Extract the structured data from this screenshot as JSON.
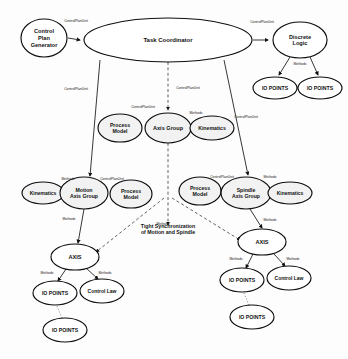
{
  "diagram": {
    "title_text": "",
    "nodes": [
      {
        "id": "control-plan-generator",
        "label_lines": [
          "Control",
          "Plan",
          "Generator"
        ],
        "cx": 44,
        "cy": 38,
        "rx": 23,
        "ry": 19,
        "font": 5.6,
        "style": "plain"
      },
      {
        "id": "task-coordinator",
        "label_lines": [
          "Task Coordinator"
        ],
        "cx": 168,
        "cy": 40,
        "rx": 84,
        "ry": 22,
        "font": 6.0,
        "style": "plain"
      },
      {
        "id": "discrete-logic",
        "label_lines": [
          "Discrete",
          "Logic"
        ],
        "cx": 300,
        "cy": 40,
        "rx": 27,
        "ry": 18,
        "font": 5.6,
        "style": "plain"
      },
      {
        "id": "io-points-dl-left",
        "label_lines": [
          "IO POINTS"
        ],
        "cx": 275,
        "cy": 88,
        "rx": 22,
        "ry": 11,
        "font": 5.2,
        "style": "plain"
      },
      {
        "id": "io-points-dl-right",
        "label_lines": [
          "IO POINTS"
        ],
        "cx": 320,
        "cy": 88,
        "rx": 22,
        "ry": 11,
        "font": 5.2,
        "style": "plain"
      },
      {
        "id": "process-model-center",
        "label_lines": [
          "Process",
          "Model"
        ],
        "cx": 120,
        "cy": 128,
        "rx": 22,
        "ry": 14,
        "font": 5.2,
        "style": "shaded"
      },
      {
        "id": "axis-group",
        "label_lines": [
          "Axis Group"
        ],
        "cx": 168,
        "cy": 128,
        "rx": 23,
        "ry": 15,
        "font": 5.6,
        "style": "shaded"
      },
      {
        "id": "kinematics-center",
        "label_lines": [
          "Kinematics"
        ],
        "cx": 212,
        "cy": 128,
        "rx": 22,
        "ry": 12,
        "font": 5.2,
        "style": "shaded"
      },
      {
        "id": "kinematics-left",
        "label_lines": [
          "Kinematics"
        ],
        "cx": 43,
        "cy": 193,
        "rx": 21,
        "ry": 11,
        "font": 5.0,
        "style": "shaded"
      },
      {
        "id": "motion-axis-group",
        "label_lines": [
          "Motion",
          "Axis Group"
        ],
        "cx": 84,
        "cy": 193,
        "rx": 24,
        "ry": 16,
        "font": 5.2,
        "style": "shaded"
      },
      {
        "id": "process-model-left",
        "label_lines": [
          "Process",
          "Model"
        ],
        "cx": 131,
        "cy": 194,
        "rx": 21,
        "ry": 14,
        "font": 5.2,
        "style": "shaded"
      },
      {
        "id": "process-model-right",
        "label_lines": [
          "Process",
          "Model"
        ],
        "cx": 200,
        "cy": 191,
        "rx": 21,
        "ry": 14,
        "font": 5.2,
        "style": "shaded"
      },
      {
        "id": "spindle-axis-group",
        "label_lines": [
          "Spindle",
          "Axis Group"
        ],
        "cx": 246,
        "cy": 193,
        "rx": 25,
        "ry": 16,
        "font": 5.2,
        "style": "shaded"
      },
      {
        "id": "kinematics-right",
        "label_lines": [
          "Kinematics"
        ],
        "cx": 290,
        "cy": 193,
        "rx": 22,
        "ry": 11,
        "font": 5.0,
        "style": "shaded"
      },
      {
        "id": "axis-left",
        "label_lines": [
          "AXIS"
        ],
        "cx": 75,
        "cy": 257,
        "rx": 24,
        "ry": 13,
        "font": 5.6,
        "style": "plain"
      },
      {
        "id": "axis-right",
        "label_lines": [
          "AXIS"
        ],
        "cx": 262,
        "cy": 242,
        "rx": 24,
        "ry": 13,
        "font": 5.6,
        "style": "plain"
      },
      {
        "id": "io-points-left",
        "label_lines": [
          "IO POINTS"
        ],
        "cx": 55,
        "cy": 293,
        "rx": 22,
        "ry": 12,
        "font": 5.2,
        "style": "plain"
      },
      {
        "id": "control-law-left",
        "label_lines": [
          "Control Law"
        ],
        "cx": 102,
        "cy": 291,
        "rx": 22,
        "ry": 12,
        "font": 5.0,
        "style": "plain"
      },
      {
        "id": "io-points-left-2",
        "label_lines": [
          "IO POINTS"
        ],
        "cx": 65,
        "cy": 330,
        "rx": 22,
        "ry": 12,
        "font": 5.2,
        "style": "plain"
      },
      {
        "id": "io-points-right",
        "label_lines": [
          "IO POINTS"
        ],
        "cx": 242,
        "cy": 280,
        "rx": 22,
        "ry": 12,
        "font": 5.2,
        "style": "plain"
      },
      {
        "id": "control-law-right",
        "label_lines": [
          "Control Law"
        ],
        "cx": 289,
        "cy": 278,
        "rx": 22,
        "ry": 12,
        "font": 5.0,
        "style": "plain"
      },
      {
        "id": "io-points-right-2",
        "label_lines": [
          "IO POINTS"
        ],
        "cx": 252,
        "cy": 317,
        "rx": 22,
        "ry": 12,
        "font": 5.2,
        "style": "plain"
      }
    ],
    "edges": [
      {
        "id": "cpg-to-tc",
        "kind": "solid",
        "path": "M 68 38 L 80 40",
        "label": "ControlPlanUnit",
        "lx": 76,
        "ly": 22
      },
      {
        "id": "tc-to-dl",
        "kind": "solid",
        "path": "M 253 40 L 268 40",
        "label": "ControlPlanUnit",
        "lx": 262,
        "ly": 23
      },
      {
        "id": "dl-to-io-left",
        "kind": "solid",
        "path": "M 290 57 L 279 75",
        "label": "Methods",
        "lx": 300,
        "ly": 65
      },
      {
        "id": "dl-to-io-right",
        "kind": "solid",
        "path": "M 310 57 L 318 75",
        "label": "",
        "lx": 0,
        "ly": 0
      },
      {
        "id": "io-dl-link",
        "kind": "dotted",
        "path": "M 297 88 L 299 88",
        "label": "",
        "lx": 0,
        "ly": 0
      },
      {
        "id": "tc-to-axisgroup",
        "kind": "dashed",
        "path": "M 168 62 L 168 110",
        "label": "ControlPlanUnit",
        "lx": 188,
        "ly": 89
      },
      {
        "id": "axisgroup-cpu-label",
        "kind": "none",
        "path": "",
        "label": "ControlPlanUnit",
        "lx": 143,
        "ly": 108
      },
      {
        "id": "axisgroup-methods-label",
        "kind": "none",
        "path": "",
        "label": "Methods",
        "lx": 196,
        "ly": 114
      },
      {
        "id": "tc-to-motion",
        "kind": "solid",
        "path": "M 100 60 L 90 176",
        "label": "ControlPlanUnit",
        "lx": 76,
        "ly": 90
      },
      {
        "id": "tc-to-spindle",
        "kind": "solid",
        "path": "M 224 60 L 248 175",
        "label": "ControlPlanUnit",
        "lx": 246,
        "ly": 118
      },
      {
        "id": "motion-cpu-label",
        "kind": "none",
        "path": "",
        "label": "ControlPlanUnit",
        "lx": 112,
        "ly": 180
      },
      {
        "id": "motion-methods-label",
        "kind": "none",
        "path": "",
        "label": "Methods",
        "lx": 68,
        "ly": 180
      },
      {
        "id": "spindle-cpu-label",
        "kind": "none",
        "path": "",
        "label": "ControlPlanUnit",
        "lx": 222,
        "ly": 178
      },
      {
        "id": "spindle-methods-label",
        "kind": "none",
        "path": "",
        "label": "Methods",
        "lx": 270,
        "ly": 178
      },
      {
        "id": "axisgroup-down-dashed",
        "kind": "dashed",
        "path": "M 168 143 L 168 225",
        "label": "Methods",
        "lx": 163,
        "ly": 225
      },
      {
        "id": "motion-to-axis",
        "kind": "solid",
        "path": "M 84 209 L 78 243",
        "label": "Methods",
        "lx": 69,
        "ly": 220
      },
      {
        "id": "spindle-to-axis",
        "kind": "solid",
        "path": "M 250 209 L 262 228",
        "label": "Methods",
        "lx": 270,
        "ly": 221
      },
      {
        "id": "sync-left",
        "kind": "dashed",
        "path": "M 164 198 L 96 252",
        "label": "",
        "lx": 0,
        "ly": 0
      },
      {
        "id": "sync-right",
        "kind": "dashed",
        "path": "M 172 198 L 240 240",
        "label": "",
        "lx": 0,
        "ly": 0
      },
      {
        "id": "axisleft-to-io",
        "kind": "solid",
        "path": "M 66 269 L 58 281",
        "label": "Methods",
        "lx": 47,
        "ly": 274
      },
      {
        "id": "axisleft-to-cl",
        "kind": "solid",
        "path": "M 86 268 L 98 279",
        "label": "Methods",
        "lx": 105,
        "ly": 274
      },
      {
        "id": "io-left-link",
        "kind": "dotted",
        "path": "M 57 306 L 62 318",
        "label": "",
        "lx": 0,
        "ly": 0
      },
      {
        "id": "axisright-to-io",
        "kind": "solid",
        "path": "M 253 254 L 246 268",
        "label": "Methods",
        "lx": 236,
        "ly": 260
      },
      {
        "id": "axisright-to-cl",
        "kind": "solid",
        "path": "M 274 254 L 285 266",
        "label": "Methods",
        "lx": 293,
        "ly": 260
      },
      {
        "id": "io-right-link",
        "kind": "dotted",
        "path": "M 244 293 L 249 305",
        "label": "",
        "lx": 0,
        "ly": 0
      }
    ],
    "annotations": [
      {
        "id": "sync-note",
        "lines": [
          "Tight Synchronization",
          "of Motion and Spindle"
        ],
        "x": 168,
        "y": 228
      }
    ]
  },
  "labels": {
    "control_plan_unit": "ControlPlanUnit",
    "methods": "Methods"
  }
}
